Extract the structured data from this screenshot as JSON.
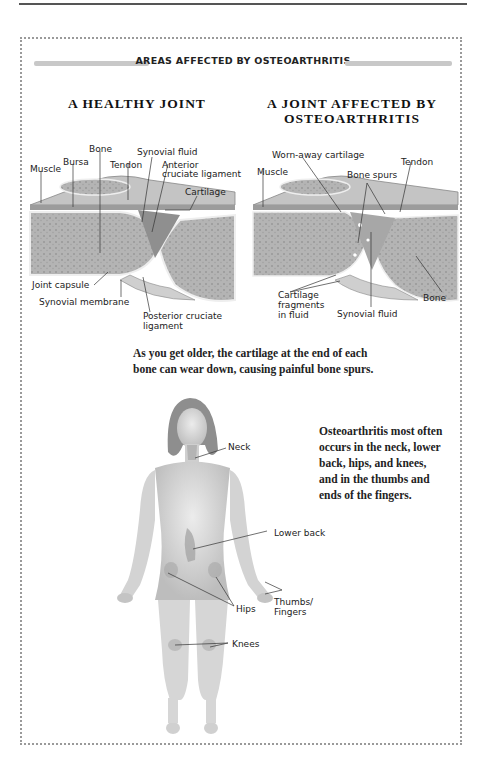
{
  "section_title": "AREAS AFFECTED BY OSTEOARTHRITIS",
  "healthy_joint": {
    "title": "A HEALTHY JOINT",
    "labels": {
      "muscle": "Muscle",
      "bursa": "Bursa",
      "bone": "Bone",
      "tendon": "Tendon",
      "synovial_fluid": "Synovial fluid",
      "anterior_1": "Anterior",
      "anterior_2": "cruciate ligament",
      "cartilage": "Cartilage",
      "joint_capsule": "Joint capsule",
      "synovial_membrane": "Synovial membrane",
      "posterior_1": "Posterior cruciate",
      "posterior_2": "ligament"
    }
  },
  "affected_joint": {
    "title_line1": "A JOINT AFFECTED BY",
    "title_line2": "OSTEOARTHRITIS",
    "labels": {
      "worn_cartilage": "Worn-away cartilage",
      "tendon": "Tendon",
      "muscle": "Muscle",
      "bone_spurs": "Bone spurs",
      "fragments_1": "Cartilage",
      "fragments_2": "fragments",
      "fragments_3": "in fluid",
      "synovial_fluid": "Synovial fluid",
      "bone": "Bone"
    }
  },
  "joint_caption_1": "As you get older, the cartilage at the end of each",
  "joint_caption_2": "bone can wear down, causing painful bone spurs.",
  "body": {
    "labels": {
      "neck": "Neck",
      "lower_back": "Lower back",
      "hips": "Hips",
      "thumbs_1": "Thumbs/",
      "thumbs_2": "Fingers",
      "knees": "Knees"
    },
    "caption_lines": [
      "Osteoarthritis most often",
      "occurs in the neck, lower",
      "back, hips, and knees,",
      "and in the thumbs and",
      "ends of the fingers."
    ]
  },
  "colors": {
    "bone": "#a9a9a9",
    "tissue": "#cfcfcf",
    "skin": "#d9d9d9",
    "highlight": "#9a9a9a",
    "border": "#9a9a9a"
  }
}
